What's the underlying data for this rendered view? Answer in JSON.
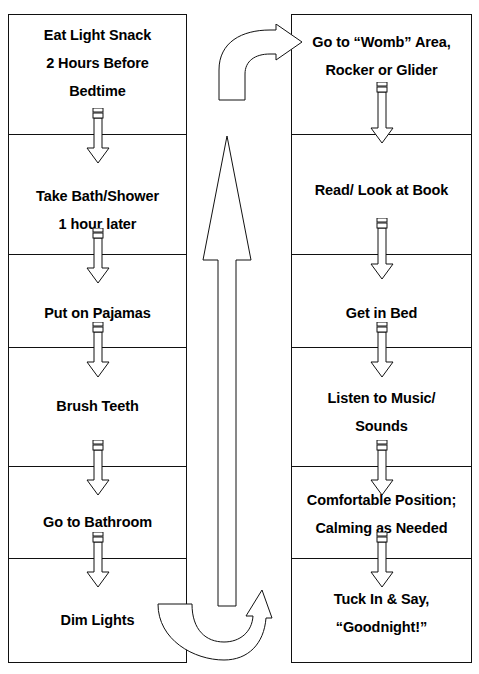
{
  "diagram": {
    "type": "two-column-sequential-flowchart",
    "stroke_color": "#111111",
    "text_color": "#000000",
    "background_color": "#ffffff"
  },
  "left_column": {
    "name": "left-sequence",
    "steps": [
      {
        "id": "eat-light-snack",
        "lines": [
          "Eat Light Snack",
          "2 Hours Before",
          "Bedtime"
        ]
      },
      {
        "id": "take-bath-shower",
        "lines": [
          "Take Bath/Shower",
          "1 hour later"
        ]
      },
      {
        "id": "put-on-pajamas",
        "lines": [
          "Put on Pajamas"
        ]
      },
      {
        "id": "brush-teeth",
        "lines": [
          "Brush Teeth"
        ]
      },
      {
        "id": "go-to-bathroom",
        "lines": [
          "Go to Bathroom"
        ]
      },
      {
        "id": "dim-lights",
        "lines": [
          "Dim Lights"
        ]
      }
    ]
  },
  "right_column": {
    "name": "right-sequence",
    "steps": [
      {
        "id": "go-to-womb-area",
        "lines": [
          "Go to “Womb” Area,",
          "Rocker or Glider"
        ]
      },
      {
        "id": "read-look-at-book",
        "lines": [
          "Read/ Look at Book"
        ]
      },
      {
        "id": "get-in-bed",
        "lines": [
          "Get in Bed"
        ]
      },
      {
        "id": "listen-to-music",
        "lines": [
          "Listen to Music/",
          "Sounds"
        ]
      },
      {
        "id": "comfortable-position",
        "lines": [
          "Comfortable Position;",
          "Calming as Needed"
        ]
      },
      {
        "id": "tuck-in-and-say",
        "lines": [
          "Tuck In & Say,",
          "“Goodnight!”"
        ]
      }
    ]
  },
  "connectors": {
    "step_arrows": {
      "style": "fletched-down-arrow",
      "count_left": 5,
      "count_right": 5,
      "direction": "down"
    },
    "center_riser": {
      "id": "center-up-arrow",
      "direction": "up",
      "description": "Tall vertical arrow rising from the bottom of the page toward the top connector"
    },
    "bottom_return": {
      "id": "bottom-u-turn-arrow",
      "direction": "u-turn-up",
      "description": "Curved arrow leaving the left column after Dim Lights and turning upward"
    },
    "top_transfer": {
      "id": "top-curve-arrow",
      "direction": "curve-right",
      "description": "Curved arrow bending right into the first box of the right column"
    }
  }
}
